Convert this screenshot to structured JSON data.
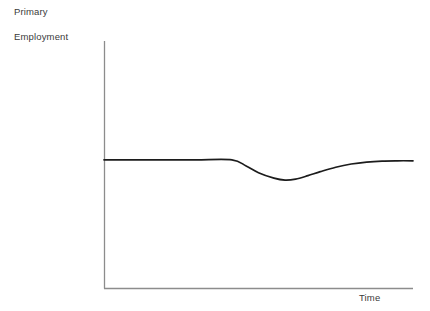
{
  "figure": {
    "background_color": "#ffffff",
    "width": 430,
    "height": 311
  },
  "labels": {
    "y_line1": "Primary",
    "y_line2": "Employment",
    "x": "Time"
  },
  "style": {
    "axis_color": "#8c8c8c",
    "curve_color": "#1c1c1c",
    "text_color": "#3a3a3a"
  },
  "chart_data": {
    "type": "line",
    "title": "",
    "xlabel": "Time",
    "ylabel": "Primary Employment",
    "grid": false,
    "legend": null,
    "axis_ticks": {
      "x": [],
      "y": []
    },
    "xlim": [
      0,
      100
    ],
    "ylim": [
      0,
      100
    ],
    "series": [
      {
        "name": "Primary Employment",
        "x": [
          0,
          10,
          20,
          30,
          41.4,
          46,
          50,
          55,
          58.6,
          62,
          66,
          70,
          75,
          80,
          85,
          90,
          95,
          100
        ],
        "y": [
          52,
          52,
          52,
          52,
          52,
          49.5,
          46.8,
          44.6,
          43.8,
          44.2,
          45.6,
          47.2,
          49,
          50.3,
          51.1,
          51.5,
          51.6,
          51.6
        ]
      }
    ],
    "annotations": [
      {
        "text": "baseline",
        "x": 0,
        "y": 52,
        "visible": false
      }
    ]
  }
}
